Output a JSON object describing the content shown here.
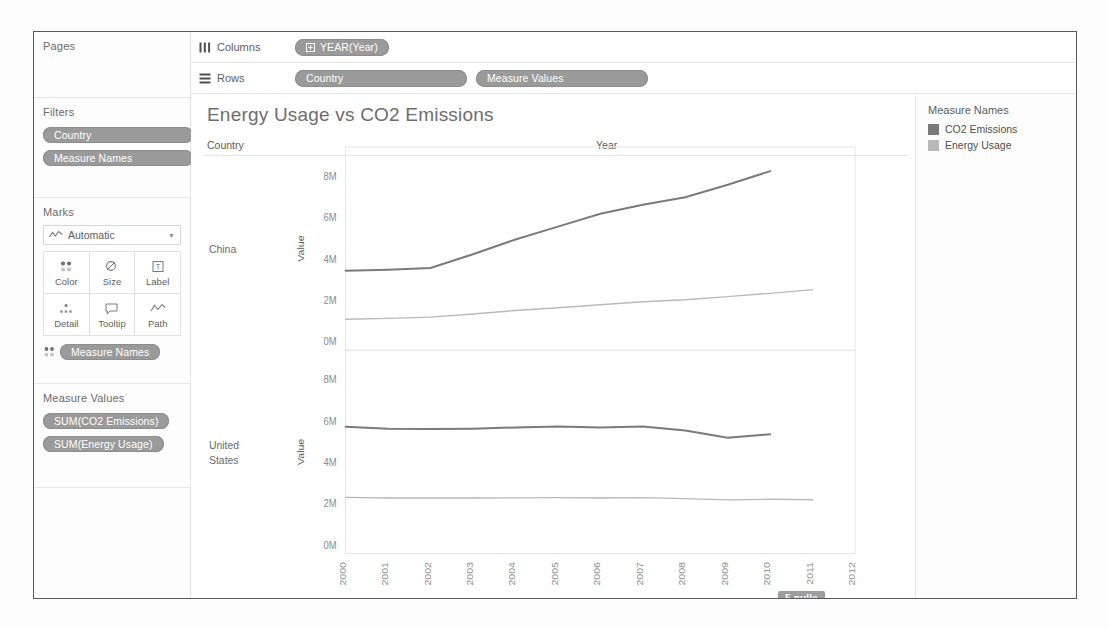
{
  "sidebar": {
    "pages": {
      "title": "Pages"
    },
    "filters": {
      "title": "Filters",
      "pills": [
        {
          "label": "Country"
        },
        {
          "label": "Measure Names"
        }
      ]
    },
    "marks": {
      "title": "Marks",
      "mark_type": "Automatic",
      "mark_type_icon": "line-chart-icon",
      "buttons": [
        {
          "label": "Color",
          "icon": "color-dots-icon"
        },
        {
          "label": "Size",
          "icon": "size-circle-icon"
        },
        {
          "label": "Label",
          "icon": "label-text-icon"
        },
        {
          "label": "Detail",
          "icon": "detail-dots-icon"
        },
        {
          "label": "Tooltip",
          "icon": "tooltip-bubble-icon"
        },
        {
          "label": "Path",
          "icon": "path-line-icon"
        }
      ],
      "encoding_pills": [
        {
          "label": "Measure Names",
          "icon": "color-dots-icon"
        }
      ]
    },
    "measure_values": {
      "title": "Measure Values",
      "pills": [
        {
          "label": "SUM(CO2 Emissions)"
        },
        {
          "label": "SUM(Energy Usage)"
        }
      ]
    }
  },
  "shelves": {
    "columns": {
      "label": "Columns",
      "icon": "columns-icon",
      "pills": [
        {
          "label": "YEAR(Year)",
          "icon": "plus-box-icon"
        }
      ]
    },
    "rows": {
      "label": "Rows",
      "icon": "rows-icon",
      "pills": [
        {
          "label": "Country"
        },
        {
          "label": "Measure Values"
        }
      ]
    }
  },
  "legend": {
    "title": "Measure Names",
    "items": [
      {
        "label": "CO2 Emissions",
        "color": "#7a7a7a"
      },
      {
        "label": "Energy Usage",
        "color": "#b9b9b9"
      }
    ]
  },
  "view": {
    "title": "Energy Usage vs CO2 Emissions",
    "country_header": "Country",
    "year_header": "Year",
    "nulls_badge": "5 nulls"
  },
  "chart_data": {
    "type": "line",
    "title": "Energy Usage vs CO2 Emissions",
    "xlabel": "Year",
    "ylabel": "Value",
    "grid": false,
    "legend_position": "right",
    "x": [
      2000,
      2001,
      2002,
      2003,
      2004,
      2005,
      2006,
      2007,
      2008,
      2009,
      2010,
      2011,
      2012
    ],
    "xtick_labels": [
      "2000",
      "2001",
      "2002",
      "2003",
      "2004",
      "2005",
      "2006",
      "2007",
      "2008",
      "2009",
      "2010",
      "2011",
      "2012"
    ],
    "ylim": [
      0,
      9000000
    ],
    "ytick_values": [
      0,
      2000000,
      4000000,
      6000000,
      8000000
    ],
    "ytick_labels": [
      "0M",
      "2M",
      "4M",
      "6M",
      "8M"
    ],
    "panels": [
      {
        "row_label": "China",
        "series": [
          {
            "name": "CO2 Emissions",
            "color": "#7a7a7a",
            "x": [
              2000,
              2001,
              2002,
              2003,
              2004,
              2005,
              2006,
              2007,
              2008,
              2009,
              2010
            ],
            "values": [
              3430000,
              3480000,
              3560000,
              4230000,
              4940000,
              5560000,
              6180000,
              6620000,
              6980000,
              7580000,
              8240000
            ]
          },
          {
            "name": "Energy Usage",
            "color": "#b9b9b9",
            "x": [
              2000,
              2001,
              2002,
              2003,
              2004,
              2005,
              2006,
              2007,
              2008,
              2009,
              2010,
              2011
            ],
            "values": [
              1090000,
              1130000,
              1190000,
              1340000,
              1510000,
              1640000,
              1790000,
              1930000,
              2030000,
              2180000,
              2340000,
              2520000
            ]
          }
        ]
      },
      {
        "row_label": "United States",
        "series": [
          {
            "name": "CO2 Emissions",
            "color": "#7a7a7a",
            "x": [
              2000,
              2001,
              2002,
              2003,
              2004,
              2005,
              2006,
              2007,
              2008,
              2009,
              2010
            ],
            "values": [
              5710000,
              5620000,
              5600000,
              5620000,
              5680000,
              5720000,
              5680000,
              5720000,
              5530000,
              5180000,
              5350000
            ]
          },
          {
            "name": "Energy Usage",
            "color": "#b9b9b9",
            "x": [
              2000,
              2001,
              2002,
              2003,
              2004,
              2005,
              2006,
              2007,
              2008,
              2009,
              2010,
              2011
            ],
            "values": [
              2300000,
              2270000,
              2270000,
              2270000,
              2280000,
              2290000,
              2270000,
              2290000,
              2240000,
              2180000,
              2210000,
              2190000
            ]
          }
        ]
      }
    ]
  }
}
